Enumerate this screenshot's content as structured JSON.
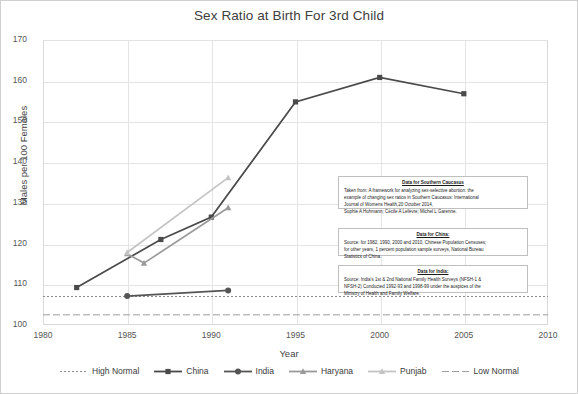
{
  "chart_data": {
    "type": "line",
    "title": "Sex Ratio at Birth For 3rd Child",
    "xlabel": "Year",
    "ylabel": "Males per 100 Females",
    "xlim": [
      1980,
      2010
    ],
    "ylim": [
      100,
      170
    ],
    "xticks": [
      1980,
      1985,
      1990,
      1995,
      2000,
      2005,
      2010
    ],
    "yticks": [
      100,
      110,
      120,
      130,
      140,
      150,
      160,
      170
    ],
    "grid": true,
    "legend_position": "bottom",
    "series": [
      {
        "name": "High Normal",
        "style": "dotted",
        "color": "#8c8c8c",
        "marker": "none",
        "points": [
          [
            1980,
            107
          ],
          [
            2010,
            107
          ]
        ]
      },
      {
        "name": "China",
        "style": "solid",
        "color": "#4a4a4a",
        "marker": "square",
        "points": [
          [
            1982,
            109.2
          ],
          [
            1987,
            121.0
          ],
          [
            1990,
            126.5
          ],
          [
            1995,
            154.8
          ],
          [
            2000,
            160.8
          ],
          [
            2005,
            156.8
          ]
        ]
      },
      {
        "name": "India",
        "style": "solid",
        "color": "#555555",
        "marker": "circle",
        "points": [
          [
            1985,
            107.1
          ],
          [
            1991,
            108.5
          ]
        ]
      },
      {
        "name": "Haryana",
        "style": "solid",
        "color": "#9a9a9a",
        "marker": "triangle",
        "points": [
          [
            1985,
            117.5
          ],
          [
            1986,
            115.2
          ],
          [
            1991,
            128.8
          ]
        ]
      },
      {
        "name": "Punjab",
        "style": "solid",
        "color": "#c4c4c4",
        "marker": "triangle",
        "points": [
          [
            1985,
            117.8
          ],
          [
            1991,
            136.2
          ]
        ]
      },
      {
        "name": "Low Normal",
        "style": "dashed",
        "color": "#9e9e9e",
        "marker": "none",
        "points": [
          [
            1980,
            102.5
          ],
          [
            2010,
            102.5
          ]
        ]
      }
    ]
  },
  "notes": {
    "caucasus": {
      "title": "Data for Southern Caucasus",
      "lines": [
        "Taken from: A framework for analyzing sex-selective abortion: the",
        "example of changing sex ratios in Southern Caucasus: International",
        "Journal of Womens  Health,20 October 2014,",
        "Sophie A Hohmann; Cécile A Lefèvre; Michel L Garenne."
      ]
    },
    "china": {
      "title": "Data for China:",
      "lines": [
        "Source: for 1982, 1990, 2000 and 2010, Chinese Population Censuses;",
        "for other years, 1 percent population sample surveys, National Bureau",
        "Statistics of China."
      ]
    },
    "india": {
      "title": "Data for India:",
      "lines": [
        "Source: India's 1st & 2nd National Family Health Surveys (NFSH-1 &",
        "NFSH-2) Conducted 1992-93 and 1998-99  under the auspices of the",
        "Ministry of Health and Family Welfare."
      ]
    }
  },
  "colors": {
    "china": "#4a4a4a",
    "india": "#555555",
    "haryana": "#9a9a9a",
    "punjab": "#c4c4c4",
    "normal_band": "#9e9e9e",
    "grid": "#e4e4e4",
    "text": "#3a3a3a"
  }
}
